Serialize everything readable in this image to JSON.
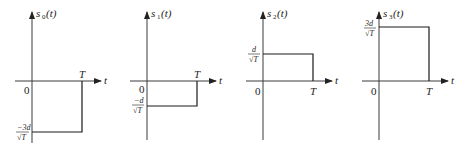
{
  "figure": {
    "panels": [
      {
        "name": "s0",
        "title_base": "s",
        "title_sub": "0",
        "title_arg": "(t)",
        "level_num": "−3d",
        "level_den": "√T",
        "level": -3
      },
      {
        "name": "s1",
        "title_base": "s",
        "title_sub": "1",
        "title_arg": "(t)",
        "level_num": "−d",
        "level_den": "√T",
        "level": -1
      },
      {
        "name": "s2",
        "title_base": "s",
        "title_sub": "2",
        "title_arg": "(t)",
        "level_num": "d",
        "level_den": "√T",
        "level": 1
      },
      {
        "name": "s3",
        "title_base": "s",
        "title_sub": "3",
        "title_arg": "(t)",
        "level_num": "3d",
        "level_den": "√T",
        "level": 3
      }
    ],
    "origin_label": "0",
    "t_axis_label": "t",
    "T_label": "T"
  }
}
